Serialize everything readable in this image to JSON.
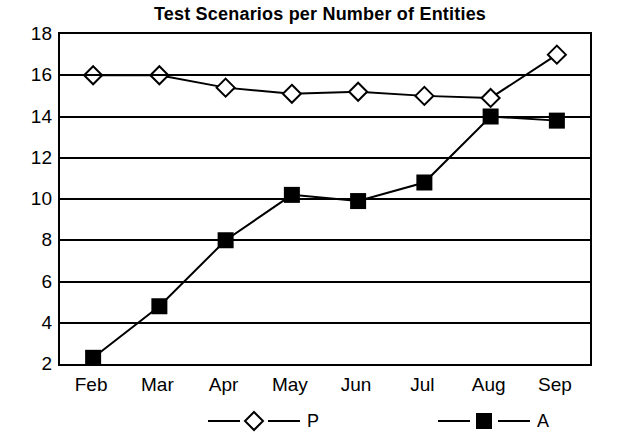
{
  "chart_data": {
    "type": "line",
    "title": "Test Scenarios per Number of Entities",
    "xlabel": "",
    "ylabel": "",
    "categories": [
      "Feb",
      "Mar",
      "Apr",
      "May",
      "Jun",
      "Jul",
      "Aug",
      "Sep"
    ],
    "ylim": [
      2,
      18
    ],
    "yticks": [
      2,
      4,
      6,
      8,
      10,
      12,
      14,
      16,
      18
    ],
    "grid": true,
    "legend_position": "bottom",
    "series": [
      {
        "name": "P",
        "marker": "diamond-open",
        "color": "#000000",
        "values": [
          16.0,
          16.0,
          15.4,
          15.1,
          15.2,
          15.0,
          14.9,
          17.0
        ]
      },
      {
        "name": "A",
        "marker": "square-filled",
        "color": "#000000",
        "values": [
          2.3,
          4.8,
          8.0,
          10.2,
          9.9,
          10.8,
          14.0,
          13.8
        ]
      }
    ]
  }
}
